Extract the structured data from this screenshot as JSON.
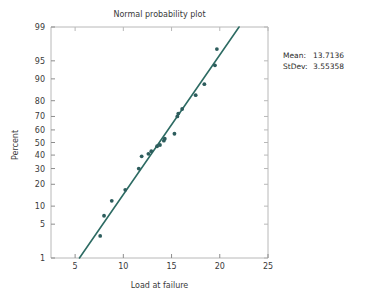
{
  "chart_data": {
    "type": "scatter",
    "title": "Normal probability plot",
    "xlabel": "Load at failure",
    "ylabel": "Percent",
    "xlim": [
      2.5,
      25
    ],
    "ylim_percent": [
      1,
      99
    ],
    "yscale": "normal-probability",
    "grid": false,
    "legend": "none",
    "xticks": [
      5,
      10,
      15,
      20,
      25
    ],
    "yticks": [
      1,
      5,
      10,
      20,
      30,
      40,
      50,
      60,
      70,
      80,
      90,
      95,
      99
    ],
    "point_color": "#2d5d5d",
    "line_color": "#2d6b63",
    "series": [
      {
        "name": "Load at failure",
        "x": [
          7.6,
          8.0,
          8.8,
          10.2,
          11.6,
          11.9,
          12.6,
          12.9,
          13.5,
          13.8,
          14.2,
          14.3,
          15.3,
          15.6,
          15.7,
          16.1,
          17.5,
          18.4,
          19.5,
          19.7
        ],
        "percent": [
          3.0,
          7.0,
          12.0,
          17.0,
          30.0,
          39.0,
          41.0,
          43.0,
          47.0,
          48.0,
          51.5,
          53.0,
          57.0,
          70.0,
          72.0,
          75.0,
          83.0,
          88.0,
          94.0,
          97.0
        ]
      }
    ],
    "fit_line": {
      "name": "normal-fit",
      "x_start": 5.45,
      "percent_start": 1.0,
      "x_end": 22.0,
      "percent_end": 99.0
    }
  },
  "stats": {
    "mean_label": "Mean:",
    "mean_value": "13.7136",
    "stdev_label": "StDev:",
    "stdev_value": "3.55358"
  }
}
